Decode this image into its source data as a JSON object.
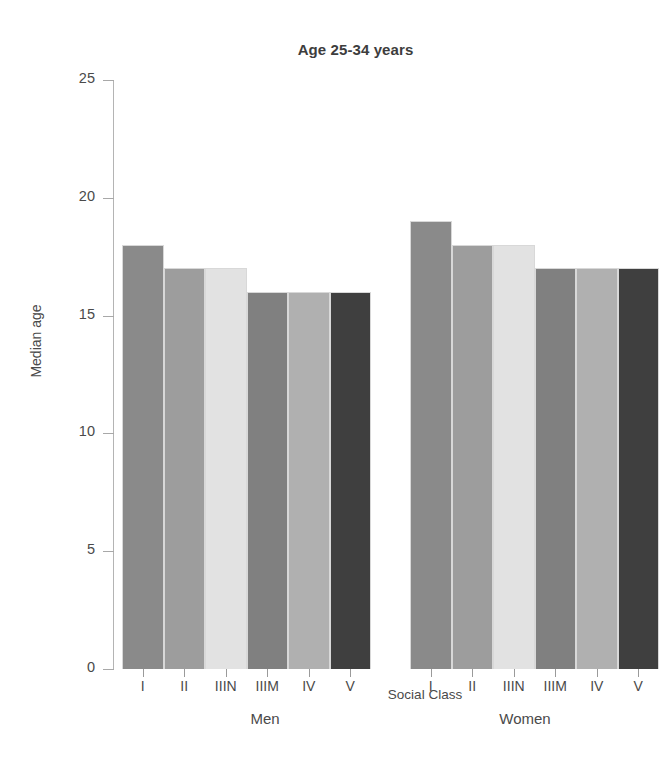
{
  "chart_data": {
    "type": "bar",
    "title": "Age 25-34 years",
    "xlabel": "Social Class",
    "ylabel": "Median age",
    "ylim": [
      0,
      25
    ],
    "yticks": [
      0,
      5,
      10,
      15,
      20,
      25
    ],
    "ytick_labels": [
      "0",
      "5",
      "10",
      "15",
      "20",
      "25"
    ],
    "grid": false,
    "legend": "none",
    "categories": [
      "I",
      "II",
      "IIIN",
      "IIIM",
      "IV",
      "V"
    ],
    "groups": [
      {
        "name": "Men",
        "values": [
          18,
          17,
          17,
          16,
          16,
          16
        ]
      },
      {
        "name": "Women",
        "values": [
          19,
          18,
          18,
          17,
          17,
          17
        ]
      }
    ],
    "bar_colors": [
      "#8a8a8a",
      "#9d9d9d",
      "#e2e2e2",
      "#808080",
      "#b0b0b0",
      "#3f3f3f"
    ]
  },
  "title": "Age 25-34 years",
  "axes": {
    "y_label": "Median age",
    "x_label": "Social Class"
  },
  "y_ticks": [
    {
      "value": 25,
      "label": "25"
    },
    {
      "value": 20,
      "label": "20"
    },
    {
      "value": 15,
      "label": "15"
    },
    {
      "value": 10,
      "label": "10"
    },
    {
      "value": 5,
      "label": "5"
    },
    {
      "value": 0,
      "label": "0"
    }
  ],
  "groups": [
    {
      "key": "men",
      "label": "Men",
      "bars": [
        {
          "category": "I",
          "value": 18,
          "color": "#8a8a8a"
        },
        {
          "category": "II",
          "value": 17,
          "color": "#9d9d9d"
        },
        {
          "category": "IIIN",
          "value": 17,
          "color": "#e2e2e2"
        },
        {
          "category": "IIIM",
          "value": 16,
          "color": "#808080"
        },
        {
          "category": "IV",
          "value": 16,
          "color": "#b0b0b0"
        },
        {
          "category": "V",
          "value": 16,
          "color": "#3f3f3f"
        }
      ]
    },
    {
      "key": "women",
      "label": "Women",
      "bars": [
        {
          "category": "I",
          "value": 19,
          "color": "#8a8a8a"
        },
        {
          "category": "II",
          "value": 18,
          "color": "#9d9d9d"
        },
        {
          "category": "IIIN",
          "value": 18,
          "color": "#e2e2e2"
        },
        {
          "category": "IIIM",
          "value": 17,
          "color": "#808080"
        },
        {
          "category": "IV",
          "value": 17,
          "color": "#b0b0b0"
        },
        {
          "category": "V",
          "value": 17,
          "color": "#3f3f3f"
        }
      ]
    }
  ]
}
